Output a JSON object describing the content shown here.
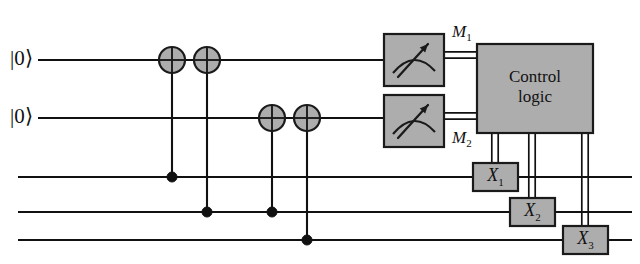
{
  "figure": {
    "width": 640,
    "height": 264,
    "background": "#ffffff",
    "ink_color": "#111111",
    "gate_fill": "#adadad",
    "gate_stroke": "#1a1a1a"
  },
  "wires": [
    {
      "id": "wire-1",
      "label": "|0⟩",
      "y": 60,
      "x_start": 38,
      "x_end": 394,
      "has_label": true
    },
    {
      "id": "wire-2",
      "label": "|0⟩",
      "y": 118,
      "x_start": 38,
      "x_end": 394,
      "has_label": true
    },
    {
      "id": "wire-3",
      "label": "",
      "y": 177,
      "x_start": 18,
      "x_end": 632,
      "has_label": false
    },
    {
      "id": "wire-4",
      "label": "",
      "y": 212,
      "x_start": 18,
      "x_end": 632,
      "has_label": false
    },
    {
      "id": "wire-5",
      "label": "",
      "y": 240,
      "x_start": 18,
      "x_end": 632,
      "has_label": false
    }
  ],
  "ket_labels": [
    {
      "name": "ket-zero-wire-1",
      "text": "|0⟩",
      "x": 36,
      "y": 60
    },
    {
      "name": "ket-zero-wire-2",
      "text": "|0⟩",
      "x": 36,
      "y": 118
    }
  ],
  "cnot_gates": [
    {
      "id": "cnot-1",
      "x": 172,
      "target_wire": 1,
      "target_y": 60,
      "control_wire": 3,
      "control_y": 177,
      "radius": 13
    },
    {
      "id": "cnot-2",
      "x": 207,
      "target_wire": 1,
      "target_y": 60,
      "control_wire": 4,
      "control_y": 212,
      "radius": 13
    },
    {
      "id": "cnot-3",
      "x": 272,
      "target_wire": 2,
      "target_y": 118,
      "control_wire": 4,
      "control_y": 212,
      "radius": 13
    },
    {
      "id": "cnot-4",
      "x": 307,
      "target_wire": 2,
      "target_y": 118,
      "control_wire": 5,
      "control_y": 240,
      "radius": 13
    }
  ],
  "measurements": [
    {
      "id": "meter-1",
      "name": "measurement-gate-1",
      "wire": 1,
      "x": 384,
      "y": 34,
      "width": 60,
      "height": 52,
      "output_label": "M",
      "output_subscript": "1",
      "label_x": 452,
      "label_y": 22
    },
    {
      "id": "meter-2",
      "name": "measurement-gate-2",
      "wire": 2,
      "x": 384,
      "y": 95,
      "width": 60,
      "height": 52,
      "output_label": "M",
      "output_subscript": "2",
      "label_x": 452,
      "label_y": 128
    }
  ],
  "control_logic": {
    "name": "control-logic-box",
    "line1": "Control",
    "line2": "logic",
    "x": 477,
    "y": 44,
    "width": 116,
    "height": 89
  },
  "correction_gates": [
    {
      "id": "x1",
      "name": "x-gate-1",
      "label": "X",
      "subscript": "1",
      "wire": 3,
      "x": 473,
      "y": 163,
      "width": 45,
      "height": 28,
      "feed_x": 495
    },
    {
      "id": "x2",
      "name": "x-gate-2",
      "label": "X",
      "subscript": "2",
      "wire": 4,
      "x": 510,
      "y": 198,
      "width": 45,
      "height": 28,
      "feed_x": 532
    },
    {
      "id": "x3",
      "name": "x-gate-3",
      "label": "X",
      "subscript": "3",
      "wire": 5,
      "x": 563,
      "y": 226,
      "width": 45,
      "height": 28,
      "feed_x": 585
    }
  ],
  "classical_buses": [
    {
      "id": "bus-m1",
      "name": "classical-bus-m1",
      "from": "meter-1",
      "to": "control-logic",
      "x_start": 444,
      "x_end": 477,
      "y": 55
    },
    {
      "id": "bus-m2",
      "name": "classical-bus-m2",
      "from": "meter-2",
      "to": "control-logic",
      "x_start": 444,
      "x_end": 477,
      "y": 116
    },
    {
      "id": "bus-x1",
      "name": "classical-bus-x1",
      "from": "control-logic",
      "to": "x1",
      "x": 495,
      "y_start": 133,
      "y_end": 163
    },
    {
      "id": "bus-x2",
      "name": "classical-bus-x2",
      "from": "control-logic",
      "to": "x2",
      "x": 532,
      "y_start": 133,
      "y_end": 198
    },
    {
      "id": "bus-x3",
      "name": "classical-bus-x3",
      "from": "control-logic",
      "to": "x3",
      "x": 585,
      "y_start": 133,
      "y_end": 226
    }
  ]
}
